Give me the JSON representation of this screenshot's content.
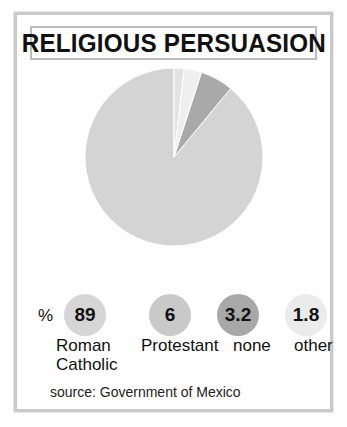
{
  "title": "RELIGIOUS PERSUASION",
  "percent_symbol": "%",
  "source": "source: Government of Mexico",
  "chart_data": {
    "type": "pie",
    "title": "RELIGIOUS PERSUASION",
    "unit": "%",
    "categories": [
      "Roman Catholic",
      "Protestant",
      "none",
      "other"
    ],
    "values": [
      89,
      6,
      3.2,
      1.8
    ],
    "value_labels": [
      "89",
      "6",
      "3.2",
      "1.8"
    ],
    "colors": [
      "#d4d4d4",
      "#a9a9a9",
      "#efefef",
      "#e2e2e2"
    ],
    "bubble_colors": [
      "#d6d6d6",
      "#c9c9c9",
      "#a8a8a8",
      "#ebebeb"
    ],
    "start_angle_deg": 0,
    "direction": "counterclockwise",
    "legend": "inline-bubbles-below",
    "source": "source: Government of Mexico"
  }
}
